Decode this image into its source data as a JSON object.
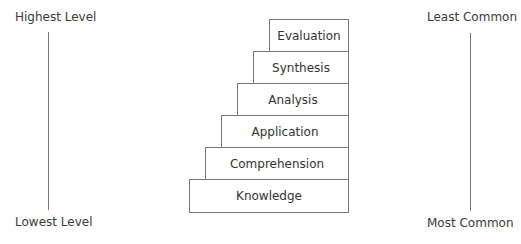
{
  "left_axis": {
    "top_label": "Highest Level",
    "bottom_label": "Lowest Level"
  },
  "right_axis": {
    "top_label": "Least Common",
    "bottom_label": "Most Common"
  },
  "staircase": {
    "steps": [
      {
        "label": "Evaluation"
      },
      {
        "label": "Synthesis"
      },
      {
        "label": "Analysis"
      },
      {
        "label": "Application"
      },
      {
        "label": "Comprehension"
      },
      {
        "label": "Knowledge"
      }
    ]
  }
}
